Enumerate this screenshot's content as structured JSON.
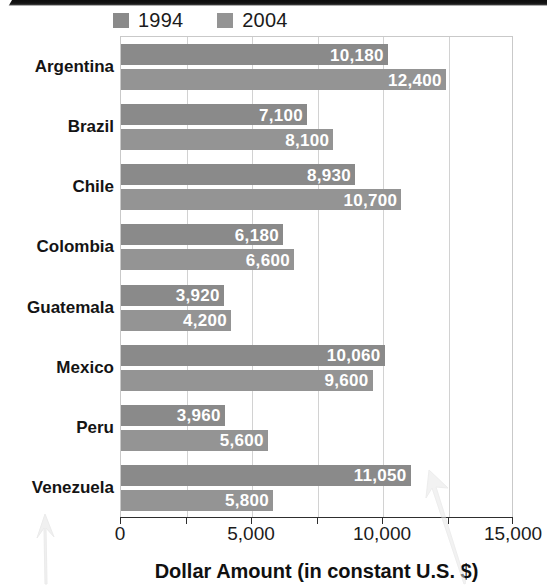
{
  "chart_data": {
    "type": "bar",
    "orientation": "horizontal",
    "title": "",
    "xlabel": "Dollar Amount (in constant U.S. $)",
    "ylabel": "",
    "xlim": [
      0,
      15000
    ],
    "xticks": [
      0,
      2500,
      5000,
      7500,
      10000,
      12500,
      15000
    ],
    "xticklabels": [
      "0",
      "",
      "5,000",
      "",
      "10,000",
      "",
      "15,000"
    ],
    "grid": true,
    "grid_axis": "x",
    "legend_position": "top-left",
    "categories": [
      "Argentina",
      "Brazil",
      "Chile",
      "Colombia",
      "Guatemala",
      "Mexico",
      "Peru",
      "Venezuela"
    ],
    "series": [
      {
        "name": "1994",
        "color": "#8a8a8a",
        "values": [
          10180,
          7100,
          8930,
          6180,
          3920,
          10060,
          3960,
          11050
        ],
        "value_labels": [
          "10,180",
          "7,100",
          "8,930",
          "6,180",
          "3,920",
          "10,060",
          "3,960",
          "11,050"
        ]
      },
      {
        "name": "2004",
        "color": "#949494",
        "values": [
          12400,
          8100,
          10700,
          6600,
          4200,
          9600,
          5600,
          5800
        ],
        "value_labels": [
          "12,400",
          "8,100",
          "10,700",
          "6,600",
          "4,200",
          "9,600",
          "5,600",
          "5,800"
        ]
      }
    ]
  },
  "legend": {
    "entries": [
      {
        "label": "1994",
        "color": "#8a8a8a"
      },
      {
        "label": "2004",
        "color": "#949494"
      }
    ]
  },
  "axis": {
    "x_title": "Dollar Amount (in constant U.S. $)",
    "tick_labels": [
      "0",
      "5,000",
      "10,000",
      "15,000"
    ]
  },
  "annotations": {
    "arrow_left_name": "pencil-arrow-annotation",
    "arrow_right_name": "pencil-arrow-annotation"
  }
}
